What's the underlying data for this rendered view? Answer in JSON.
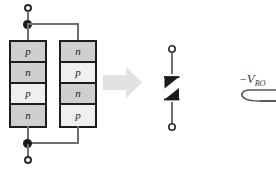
{
  "figure": {
    "background_color": "#ffffff",
    "line_color": "#6f6f6f",
    "outline_color": "#1d1d1d",
    "arrow_color": "#e2e2e2"
  },
  "structure": {
    "left_stack": {
      "name": "pnpn-stack",
      "layers": [
        {
          "label": "p",
          "shade": "dark"
        },
        {
          "label": "n",
          "shade": "dark"
        },
        {
          "label": "p",
          "shade": "light"
        },
        {
          "label": "n",
          "shade": "dark"
        }
      ]
    },
    "right_stack": {
      "name": "npnp-stack",
      "layers": [
        {
          "label": "n",
          "shade": "dark"
        },
        {
          "label": "p",
          "shade": "light"
        },
        {
          "label": "n",
          "shade": "dark"
        },
        {
          "label": "p",
          "shade": "light"
        }
      ]
    },
    "terminals": {
      "top_label": "",
      "bottom_label": ""
    }
  },
  "arrow": {
    "name": "equivalence-arrow",
    "direction": "right",
    "color": "#e2e2e2"
  },
  "symbol": {
    "name": "diac-symbol",
    "type": "bidirectional-thyristor",
    "glyph": "Z",
    "terminal_top": "",
    "terminal_bottom": ""
  },
  "curve": {
    "name": "iv-curve-fragment",
    "label_minus": "−",
    "label_v": "V",
    "label_sub": "BO",
    "full_label": "−V_BO"
  }
}
